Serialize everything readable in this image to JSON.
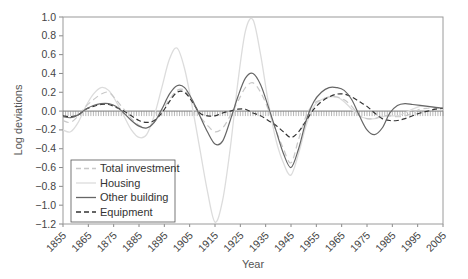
{
  "chart_data": {
    "type": "line",
    "title": "",
    "xlabel": "Year",
    "ylabel": "Log deviations",
    "xlim": [
      1855,
      2005
    ],
    "ylim": [
      -1.2,
      1.0
    ],
    "x_ticks": [
      "1855",
      "1865",
      "1875",
      "1885",
      "1895",
      "1905",
      "1915",
      "1925",
      "1935",
      "1945",
      "1955",
      "1965",
      "1975",
      "1985",
      "1995",
      "2005"
    ],
    "y_ticks": [
      "1.0",
      "0.8",
      "0.6",
      "0.4",
      "0.2",
      "0.0",
      "−0.2",
      "−0.4",
      "−0.6",
      "−0.8",
      "−1.0",
      "−1.2"
    ],
    "grid": false,
    "legend_position": "lower left",
    "zero_line_style": "hatched baseline",
    "x": [
      1855,
      1858,
      1861,
      1864,
      1867,
      1870,
      1873,
      1876,
      1879,
      1882,
      1885,
      1888,
      1891,
      1894,
      1897,
      1900,
      1903,
      1906,
      1909,
      1912,
      1915,
      1918,
      1921,
      1924,
      1927,
      1930,
      1933,
      1936,
      1939,
      1942,
      1945,
      1948,
      1951,
      1954,
      1957,
      1960,
      1963,
      1966,
      1969,
      1972,
      1975,
      1978,
      1981,
      1984,
      1987,
      1990,
      1993,
      1996,
      1999,
      2002,
      2005
    ],
    "series": [
      {
        "name": "Total investment",
        "style": "dashed",
        "color": "#c8c8c8",
        "values": [
          -0.1,
          -0.12,
          -0.05,
          0.05,
          0.12,
          0.18,
          0.2,
          0.12,
          0.02,
          -0.08,
          -0.15,
          -0.18,
          -0.12,
          0.0,
          0.12,
          0.22,
          0.22,
          0.1,
          -0.05,
          -0.15,
          -0.22,
          -0.18,
          -0.05,
          0.1,
          0.25,
          0.3,
          0.2,
          0.02,
          -0.2,
          -0.4,
          -0.55,
          -0.3,
          -0.05,
          0.08,
          0.12,
          0.15,
          0.15,
          0.12,
          0.05,
          -0.05,
          -0.08,
          -0.08,
          -0.05,
          -0.05,
          -0.06,
          -0.05,
          -0.02,
          0.02,
          0.03,
          0.03,
          0.02
        ]
      },
      {
        "name": "Housing",
        "style": "solid",
        "color": "#dcdcdc",
        "values": [
          -0.2,
          -0.22,
          -0.12,
          0.05,
          0.18,
          0.25,
          0.22,
          0.1,
          -0.05,
          -0.2,
          -0.28,
          -0.25,
          -0.05,
          0.25,
          0.55,
          0.67,
          0.45,
          0.05,
          -0.4,
          -0.85,
          -1.18,
          -0.95,
          -0.4,
          0.3,
          0.85,
          0.97,
          0.6,
          0.1,
          -0.3,
          -0.55,
          -0.68,
          -0.45,
          -0.15,
          0.05,
          0.12,
          0.15,
          0.15,
          0.1,
          0.02,
          -0.05,
          -0.08,
          -0.08,
          -0.06,
          -0.05,
          -0.05,
          -0.02,
          0.02,
          0.05,
          0.05,
          0.04,
          0.02
        ]
      },
      {
        "name": "Other building",
        "style": "solid",
        "color": "#666666",
        "values": [
          -0.06,
          -0.07,
          -0.04,
          0.02,
          0.06,
          0.08,
          0.08,
          0.05,
          -0.02,
          -0.1,
          -0.16,
          -0.18,
          -0.12,
          0.02,
          0.18,
          0.27,
          0.25,
          0.12,
          -0.05,
          -0.22,
          -0.35,
          -0.32,
          -0.1,
          0.15,
          0.35,
          0.4,
          0.28,
          0.05,
          -0.2,
          -0.45,
          -0.6,
          -0.4,
          -0.1,
          0.1,
          0.2,
          0.25,
          0.25,
          0.22,
          0.12,
          -0.05,
          -0.2,
          -0.25,
          -0.18,
          -0.02,
          0.06,
          0.08,
          0.07,
          0.06,
          0.05,
          0.04,
          0.03
        ]
      },
      {
        "name": "Equipment",
        "style": "dashed",
        "color": "#333333",
        "values": [
          -0.05,
          -0.06,
          -0.04,
          0.02,
          0.05,
          0.07,
          0.07,
          0.04,
          0.0,
          -0.05,
          -0.1,
          -0.12,
          -0.1,
          -0.02,
          0.1,
          0.2,
          0.2,
          0.1,
          -0.02,
          -0.05,
          -0.05,
          -0.02,
          0.0,
          0.02,
          0.02,
          -0.02,
          -0.05,
          -0.1,
          -0.15,
          -0.22,
          -0.28,
          -0.22,
          -0.1,
          0.02,
          0.1,
          0.15,
          0.18,
          0.18,
          0.15,
          0.1,
          0.05,
          -0.02,
          -0.08,
          -0.1,
          -0.1,
          -0.08,
          -0.05,
          -0.02,
          0.0,
          0.02,
          0.03
        ]
      }
    ]
  }
}
